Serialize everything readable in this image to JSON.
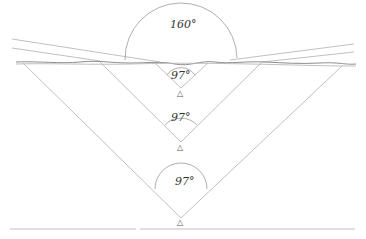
{
  "diagram": {
    "type": "viewing-angle-geometry",
    "angles": {
      "wide": "160°",
      "near": "97°",
      "middle": "97°",
      "far": "97°"
    },
    "observer_symbol": "△",
    "colors": {
      "lines": "#b9b9b9",
      "arcs": "#9a9a9a",
      "surface": "#8e8e8e",
      "text": "#333333"
    }
  }
}
